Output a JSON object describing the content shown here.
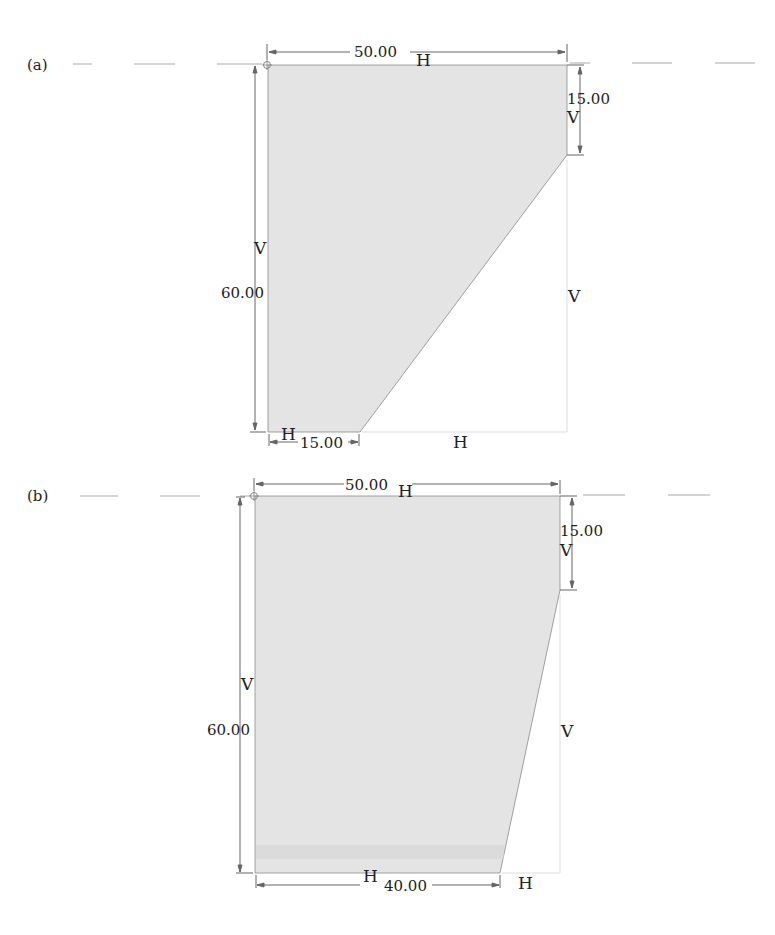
{
  "panels": [
    {
      "id": "a",
      "label": "(a)",
      "dimensions": {
        "top_width": "50.00",
        "right_offset": "15.00",
        "left_height": "60.00",
        "bottom_width": "15.00"
      },
      "constraints": {
        "top_h": "H",
        "right_v": "V",
        "left_v": "V",
        "bottom_left_h": "H",
        "bottom_right_h": "H",
        "right_far_v": "V"
      }
    },
    {
      "id": "b",
      "label": "(b)",
      "dimensions": {
        "top_width": "50.00",
        "right_offset": "15.00",
        "left_height": "60.00",
        "bottom_width": "40.00"
      },
      "constraints": {
        "top_h": "H",
        "right_v": "V",
        "left_v": "V",
        "bottom_h": "H",
        "bottom_right_h": "H",
        "right_far_v": "V"
      }
    }
  ],
  "colors": {
    "fill": "#e4e4e4",
    "line": "#555555",
    "centerline": "#aaaaaa"
  }
}
